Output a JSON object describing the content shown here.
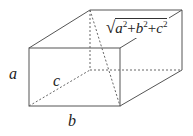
{
  "diagram": {
    "type": "rectangular-box-space-diagonal",
    "labels": {
      "a": "a",
      "b": "b",
      "c": "c"
    },
    "formula": {
      "radical": "√",
      "terms": [
        {
          "base": "a",
          "exp": "2",
          "op": "+"
        },
        {
          "base": "b",
          "exp": "2",
          "op": "+"
        },
        {
          "base": "c",
          "exp": "2",
          "op": ""
        }
      ],
      "text": "√(a²+b²+c²)"
    },
    "colors": {
      "line": "#555555",
      "text": "#222222",
      "background": "#ffffff"
    }
  }
}
